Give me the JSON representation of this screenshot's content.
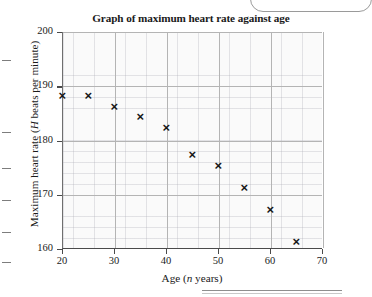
{
  "chart_data": {
    "type": "scatter",
    "title": "Graph of maximum heart rate against age",
    "xlabel": "Age (n years)",
    "ylabel": "Maximum heart rate (H beats per minute)",
    "xlabel_parts": {
      "pre": "Age (",
      "var": "n",
      "post": " years)"
    },
    "ylabel_parts": {
      "pre": "Maximum heart rate (",
      "var": "H",
      "post": " beats per minute)"
    },
    "xlim": [
      20,
      70
    ],
    "ylim": [
      160,
      200
    ],
    "xticks": [
      20,
      30,
      40,
      50,
      60,
      70
    ],
    "yticks": [
      160,
      170,
      180,
      190,
      200
    ],
    "xtick_labels": [
      "20",
      "30",
      "40",
      "50",
      "60",
      "70"
    ],
    "ytick_labels": [
      "160",
      "170",
      "180",
      "190",
      "200"
    ],
    "grid": true,
    "minor_grid": true,
    "legend": null,
    "marker": "x",
    "marker_color": "#171717",
    "x": [
      20,
      25,
      30,
      35,
      40,
      45,
      50,
      55,
      60,
      65
    ],
    "y": [
      188,
      188,
      186,
      184,
      182,
      177,
      175,
      171,
      167,
      161
    ],
    "points": [
      {
        "x": 20,
        "y": 188
      },
      {
        "x": 25,
        "y": 188
      },
      {
        "x": 30,
        "y": 186
      },
      {
        "x": 35,
        "y": 184
      },
      {
        "x": 40,
        "y": 182
      },
      {
        "x": 45,
        "y": 177
      },
      {
        "x": 50,
        "y": 175
      },
      {
        "x": 55,
        "y": 171
      },
      {
        "x": 60,
        "y": 167
      },
      {
        "x": 65,
        "y": 161
      }
    ]
  },
  "colors": {
    "background": "#ffffff",
    "plot_background": "#fafafa",
    "major_grid": "#b4b4b4",
    "axis": "#4a4a4a",
    "marker": "#171717"
  },
  "artifacts": {
    "margin_dash_count": 6
  }
}
